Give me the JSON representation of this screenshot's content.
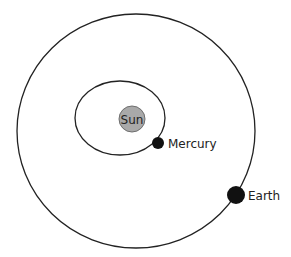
{
  "diagram": {
    "title": "",
    "colors": {
      "orbit": "#222222",
      "sun_fill": "#a9a9a9",
      "sun_stroke": "#6e6e6e",
      "planet_fill": "#111111",
      "label": "#222222"
    },
    "sun": {
      "label": "Sun",
      "cx": 132,
      "cy": 119,
      "r": 13
    },
    "orbits": [
      {
        "name": "Mercury orbit",
        "cx": 120,
        "cy": 118,
        "rx": 45,
        "ry": 37
      },
      {
        "name": "Earth orbit",
        "cx": 136,
        "cy": 131,
        "rx": 119,
        "ry": 117
      }
    ],
    "planets": [
      {
        "label": "Mercury",
        "cx": 158,
        "cy": 143,
        "r": 6,
        "label_x": 168,
        "label_y": 148
      },
      {
        "label": "Earth",
        "cx": 236,
        "cy": 195,
        "r": 9,
        "label_x": 248,
        "label_y": 200
      }
    ]
  }
}
